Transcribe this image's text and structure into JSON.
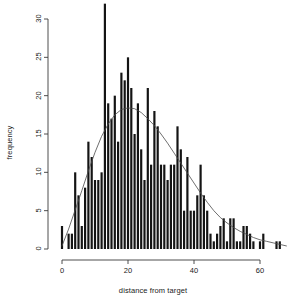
{
  "chart_data": {
    "type": "bar",
    "title": "",
    "xlabel": "distance from target",
    "ylabel": "frequency",
    "xlim": [
      -1,
      69
    ],
    "ylim": [
      0,
      32
    ],
    "xticks": [
      0,
      20,
      40,
      60
    ],
    "yticks": [
      0,
      5,
      10,
      15,
      20,
      25,
      30
    ],
    "grid": false,
    "legend": null,
    "bar_width": 0.66,
    "annotations": [
      "density curve overlay"
    ],
    "overlay": {
      "name": "density curve",
      "type": "line",
      "x": [
        0,
        2,
        4,
        6,
        8,
        10,
        12,
        14,
        16,
        18,
        20,
        22,
        24,
        26,
        28,
        30,
        32,
        34,
        36,
        38,
        40,
        42,
        44,
        46,
        48,
        50,
        52,
        54,
        56,
        58,
        60,
        62,
        64,
        66,
        68
      ],
      "y": [
        0.4,
        2.6,
        5.1,
        7.6,
        10.2,
        12.6,
        14.7,
        16.3,
        17.5,
        18.2,
        18.4,
        18.3,
        17.8,
        17.0,
        16.1,
        15.0,
        13.8,
        12.5,
        11.2,
        9.9,
        8.6,
        7.3,
        6.1,
        5.0,
        4.1,
        3.4,
        2.8,
        2.3,
        1.9,
        1.5,
        1.2,
        1.0,
        0.8,
        0.6,
        0.4
      ]
    },
    "categories": [
      0,
      1,
      2,
      3,
      4,
      5,
      6,
      7,
      8,
      9,
      10,
      11,
      12,
      13,
      14,
      15,
      16,
      17,
      18,
      19,
      20,
      21,
      22,
      23,
      24,
      25,
      26,
      27,
      28,
      29,
      30,
      31,
      32,
      33,
      34,
      35,
      36,
      37,
      38,
      39,
      40,
      41,
      42,
      43,
      44,
      45,
      46,
      47,
      48,
      49,
      50,
      51,
      52,
      53,
      54,
      55,
      56,
      57,
      58,
      59,
      60,
      61,
      62,
      63,
      64,
      65,
      66,
      67,
      68
    ],
    "values": [
      3,
      0,
      2,
      2,
      10,
      7,
      3,
      8,
      14,
      12,
      9,
      9,
      10,
      32,
      19,
      17,
      20,
      14,
      23,
      22,
      25,
      21,
      15,
      19,
      13,
      9,
      21,
      11,
      18,
      16,
      11,
      11,
      9,
      11,
      11,
      16,
      13,
      5,
      12,
      5,
      5,
      7,
      11,
      7,
      5,
      2,
      1,
      2,
      3,
      4,
      1,
      4,
      4,
      1,
      1,
      3,
      3,
      2,
      1,
      0,
      1,
      2,
      0,
      0,
      0,
      1,
      1,
      0,
      0
    ]
  },
  "axis": {
    "x_tick_labels": [
      "0",
      "20",
      "40",
      "60"
    ],
    "y_tick_labels": [
      "0",
      "5",
      "10",
      "15",
      "20",
      "25",
      "30"
    ],
    "xlabel": "distance from target",
    "ylabel": "frequency"
  }
}
